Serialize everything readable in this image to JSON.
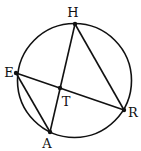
{
  "diagram": {
    "type": "circle-geometry",
    "stroke_color": "#111111",
    "background": "#ffffff",
    "circle": {
      "cx": 74.5,
      "cy": 80.5,
      "r": 57
    },
    "points": [
      {
        "id": "H",
        "label": "H",
        "x": 75,
        "y": 24,
        "lx": 73,
        "ly": 17
      },
      {
        "id": "E",
        "label": "E",
        "x": 16,
        "y": 73,
        "lx": 9,
        "ly": 77
      },
      {
        "id": "A",
        "label": "A",
        "x": 50,
        "y": 132,
        "lx": 47,
        "ly": 148
      },
      {
        "id": "R",
        "label": "R",
        "x": 124,
        "y": 110,
        "lx": 133,
        "ly": 117
      },
      {
        "id": "T",
        "label": "T",
        "x": 60,
        "y": 88,
        "lx": 66,
        "ly": 106
      }
    ],
    "segments": [
      {
        "from": "H",
        "to": "A"
      },
      {
        "from": "H",
        "to": "R"
      },
      {
        "from": "E",
        "to": "R"
      },
      {
        "from": "E",
        "to": "A"
      }
    ]
  }
}
